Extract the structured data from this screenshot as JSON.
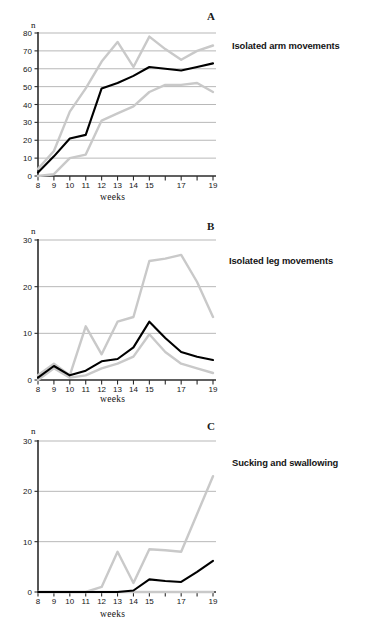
{
  "figure": {
    "colors": {
      "median": "#000000",
      "range": "#c9c9c9",
      "axis": "#2b2b2b",
      "grid": "#9a9a9a",
      "background": "#ffffff"
    },
    "x_title": "weeks",
    "y_title": "n"
  },
  "chart_data": [
    {
      "type": "line",
      "panel": "A",
      "title": "Isolated arm movements",
      "xlabel": "weeks",
      "ylabel": "n",
      "xlim": [
        8,
        19
      ],
      "ylim": [
        0,
        80
      ],
      "yticks": [
        0,
        10,
        20,
        30,
        40,
        50,
        60,
        70,
        80
      ],
      "xticks": [
        8,
        9,
        10,
        11,
        12,
        13,
        14,
        15,
        16,
        17,
        18,
        19
      ],
      "xtick_labels": [
        "8",
        "9",
        "10",
        "11",
        "12",
        "13",
        "14",
        "15",
        "",
        "17",
        "",
        "19"
      ],
      "grid": true,
      "legend": "none",
      "x": [
        8,
        9,
        10,
        11,
        12,
        13,
        14,
        15,
        16,
        17,
        18,
        19
      ],
      "series": [
        {
          "name": "median",
          "color": "#000000",
          "values": [
            2,
            11,
            21,
            23,
            49,
            52,
            56,
            61,
            60,
            59,
            61,
            63
          ]
        },
        {
          "name": "upper range",
          "color": "#c9c9c9",
          "values": [
            4,
            14,
            36,
            49,
            64,
            75,
            61,
            78,
            71,
            65,
            70,
            73
          ]
        },
        {
          "name": "lower range",
          "color": "#c9c9c9",
          "values": [
            0,
            1,
            10,
            12,
            31,
            35,
            39,
            47,
            51,
            51,
            52,
            47
          ]
        }
      ]
    },
    {
      "type": "line",
      "panel": "B",
      "title": "Isolated leg movements",
      "xlabel": "weeks",
      "ylabel": "n",
      "xlim": [
        8,
        19
      ],
      "ylim": [
        0,
        30
      ],
      "yticks": [
        0,
        10,
        20,
        30
      ],
      "xticks": [
        8,
        9,
        10,
        11,
        12,
        13,
        14,
        15,
        16,
        17,
        18,
        19
      ],
      "xtick_labels": [
        "8",
        "9",
        "10",
        "11",
        "12",
        "13",
        "14",
        "15",
        "",
        "17",
        "",
        "19"
      ],
      "grid": true,
      "legend": "none",
      "x": [
        8,
        9,
        10,
        11,
        12,
        13,
        14,
        15,
        16,
        17,
        18,
        19
      ],
      "series": [
        {
          "name": "median",
          "color": "#000000",
          "values": [
            0.5,
            3,
            1,
            2,
            4,
            4.5,
            7,
            12.5,
            9,
            6,
            5,
            4.3
          ]
        },
        {
          "name": "upper range",
          "color": "#c9c9c9",
          "values": [
            1,
            3.5,
            1,
            11.5,
            5.5,
            12.5,
            13.5,
            25.5,
            26,
            26.8,
            21,
            13.5
          ]
        },
        {
          "name": "lower range",
          "color": "#c9c9c9",
          "values": [
            0,
            2.5,
            0.5,
            1,
            2.5,
            3.5,
            5,
            9.8,
            6,
            3.5,
            2.5,
            1.5
          ]
        }
      ]
    },
    {
      "type": "line",
      "panel": "C",
      "title": "Sucking and swallowing",
      "xlabel": "weeks",
      "ylabel": "n",
      "xlim": [
        8,
        19
      ],
      "ylim": [
        0,
        30
      ],
      "yticks": [
        0,
        10,
        20,
        30
      ],
      "xticks": [
        8,
        9,
        10,
        11,
        12,
        13,
        14,
        15,
        16,
        17,
        18,
        19
      ],
      "xtick_labels": [
        "8",
        "9",
        "10",
        "11",
        "12",
        "13",
        "14",
        "15",
        "",
        "17",
        "",
        "19"
      ],
      "grid": true,
      "legend": "none",
      "x": [
        8,
        9,
        10,
        11,
        12,
        13,
        14,
        15,
        16,
        17,
        18,
        19
      ],
      "series": [
        {
          "name": "median",
          "color": "#000000",
          "values": [
            0,
            0,
            0,
            0,
            0,
            0,
            0.3,
            2.5,
            2.2,
            2,
            4,
            6.2
          ]
        },
        {
          "name": "upper range",
          "color": "#c9c9c9",
          "values": [
            0,
            0,
            0,
            0,
            1,
            8,
            1.8,
            8.5,
            8.3,
            8,
            15.5,
            23
          ]
        },
        {
          "name": "lower range",
          "color": "#c9c9c9",
          "values": [
            0,
            0,
            0,
            0,
            0,
            0,
            0,
            0,
            0,
            0,
            0,
            0
          ]
        }
      ]
    }
  ]
}
